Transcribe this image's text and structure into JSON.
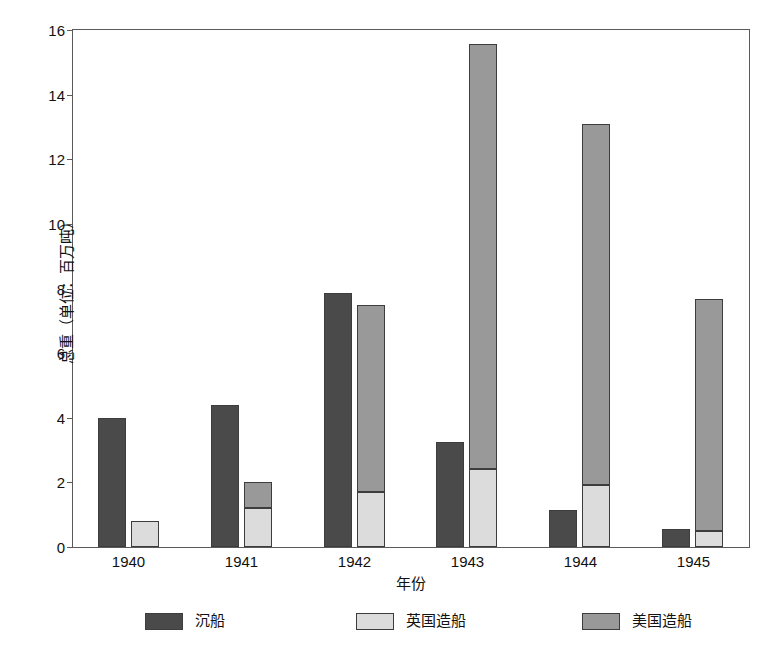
{
  "chart_data": {
    "type": "bar",
    "title": "",
    "subtitle": "",
    "xlabel": "年份",
    "ylabel": "总重（单位：百万吨）",
    "categories": [
      "1940",
      "1941",
      "1942",
      "1943",
      "1944",
      "1945"
    ],
    "ylim": [
      0,
      16
    ],
    "yticks": [
      0,
      2,
      4,
      6,
      8,
      10,
      12,
      14,
      16
    ],
    "ytick_labels": [
      "0",
      "2",
      "4",
      "6",
      "8",
      "10",
      "12",
      "14",
      "16"
    ],
    "grid": false,
    "legend_position": "bottom",
    "grouping": "sunk bar standalone; UK and US shipbuilding stacked in second bar",
    "series": [
      {
        "name": "沉船",
        "color": "#4a4a4a",
        "stacked": false,
        "values": [
          4.0,
          4.4,
          7.85,
          3.25,
          1.15,
          0.55
        ]
      },
      {
        "name": "英国造船",
        "color": "#dcdcdc",
        "stacked": true,
        "values": [
          0.8,
          1.2,
          1.7,
          2.4,
          1.9,
          0.5
        ]
      },
      {
        "name": "美国造船",
        "color": "#999999",
        "stacked": true,
        "values": [
          0.0,
          0.8,
          5.75,
          13.1,
          11.15,
          7.15
        ]
      }
    ],
    "stack_totals": [
      0.8,
      2.0,
      7.45,
      15.5,
      13.05,
      7.65
    ]
  },
  "legend": {
    "items": [
      {
        "label": "沉船",
        "color": "#4a4a4a"
      },
      {
        "label": "英国造船",
        "color": "#dcdcdc"
      },
      {
        "label": "美国造船",
        "color": "#999999"
      }
    ]
  },
  "colors": {
    "sunk": "#4a4a4a",
    "uk": "#dcdcdc",
    "us": "#999999",
    "axis": "#5a5a5a",
    "bar_outline": "#3d3d3d",
    "background": "#ffffff",
    "text": "#111111"
  }
}
